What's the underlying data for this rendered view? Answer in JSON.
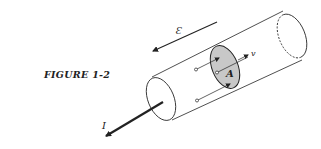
{
  "caption": "FIGURE 1-2",
  "labels": {
    "field": "Ɛ",
    "current": "I",
    "velocity": "v",
    "area": "A"
  },
  "colors": {
    "ink": "#222222",
    "shade": "#c8c8c8",
    "background": "#ffffff"
  }
}
